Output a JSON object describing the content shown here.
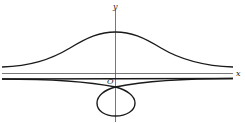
{
  "diagram": {
    "type": "curve-plot",
    "axes": {
      "x_label": "x",
      "y_label": "y",
      "origin_label": "O"
    },
    "colors": {
      "curve": "#1a1a1a",
      "axis": "#555555",
      "background": "#ffffff"
    },
    "curves": [
      {
        "name": "upper-branch",
        "description": "bell-shaped branch above x-axis, asymptotic to a horizontal line"
      },
      {
        "name": "lower-branch",
        "description": "branch below x-axis with a node on the y-axis, asymptotic to the same horizontal line"
      },
      {
        "name": "loop",
        "description": "closed loop below the node, symmetric about the y-axis"
      },
      {
        "name": "asymptote",
        "description": "horizontal line just below the x-axis"
      }
    ]
  }
}
